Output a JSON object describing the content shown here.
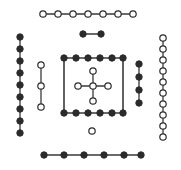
{
  "figure": {
    "title": "",
    "background_color": "#ffffff",
    "edge_color": "#3a3a3a",
    "node_stroke_color": "#2b2b2b",
    "filled_node_color": "#2b2b2b",
    "open_node_color": "#ffffff",
    "width": 181,
    "height": 170
  },
  "chart_data": {
    "type": "scatter",
    "title": "",
    "subtitle": "",
    "xlabel": "",
    "ylabel": "",
    "xlim": [
      0,
      181
    ],
    "ylim": [
      0,
      170
    ],
    "grid": false,
    "legend": null,
    "node_styles": {
      "filled": {
        "fill": "#2b2b2b",
        "stroke": "#2b2b2b",
        "radius": 3.2
      },
      "open": {
        "fill": "#ffffff",
        "stroke": "#2b2b2b",
        "radius": 3.2
      }
    },
    "components": [
      {
        "id": "top-path",
        "name": "top-open-path",
        "shape": "path",
        "node_style": "open",
        "node_count": 7,
        "nodes": [
          {
            "id": "t1",
            "x": 43,
            "y": 14
          },
          {
            "id": "t2",
            "x": 58,
            "y": 14
          },
          {
            "id": "t3",
            "x": 73,
            "y": 14
          },
          {
            "id": "t4",
            "x": 88,
            "y": 14
          },
          {
            "id": "t5",
            "x": 103,
            "y": 14
          },
          {
            "id": "t6",
            "x": 118,
            "y": 14
          },
          {
            "id": "t7",
            "x": 133,
            "y": 14
          }
        ],
        "edges": [
          [
            "t1",
            "t2"
          ],
          [
            "t2",
            "t3"
          ],
          [
            "t3",
            "t4"
          ],
          [
            "t4",
            "t5"
          ],
          [
            "t5",
            "t6"
          ],
          [
            "t6",
            "t7"
          ]
        ]
      },
      {
        "id": "dumbbell",
        "name": "filled-dumbbell",
        "shape": "path",
        "node_style": "filled",
        "node_count": 2,
        "nodes": [
          {
            "id": "d1",
            "x": 83,
            "y": 34
          },
          {
            "id": "d2",
            "x": 101,
            "y": 34
          }
        ],
        "edges": [
          [
            "d1",
            "d2"
          ]
        ]
      },
      {
        "id": "left-column",
        "name": "left-filled-path",
        "shape": "path",
        "node_style": "filled",
        "node_count": 9,
        "nodes": [
          {
            "id": "l1",
            "x": 20,
            "y": 37
          },
          {
            "id": "l2",
            "x": 20,
            "y": 49
          },
          {
            "id": "l3",
            "x": 20,
            "y": 61
          },
          {
            "id": "l4",
            "x": 20,
            "y": 73
          },
          {
            "id": "l5",
            "x": 20,
            "y": 85
          },
          {
            "id": "l6",
            "x": 20,
            "y": 97
          },
          {
            "id": "l7",
            "x": 20,
            "y": 109
          },
          {
            "id": "l8",
            "x": 20,
            "y": 121
          },
          {
            "id": "l9",
            "x": 20,
            "y": 133
          }
        ],
        "edges": [
          [
            "l1",
            "l2"
          ],
          [
            "l2",
            "l3"
          ],
          [
            "l3",
            "l4"
          ],
          [
            "l4",
            "l5"
          ],
          [
            "l5",
            "l6"
          ],
          [
            "l6",
            "l7"
          ],
          [
            "l7",
            "l8"
          ],
          [
            "l8",
            "l9"
          ]
        ]
      },
      {
        "id": "left-inner-column",
        "name": "left-inner-open-path",
        "shape": "path",
        "node_style": "open",
        "node_count": 3,
        "nodes": [
          {
            "id": "li1",
            "x": 41,
            "y": 65
          },
          {
            "id": "li2",
            "x": 41,
            "y": 86
          },
          {
            "id": "li3",
            "x": 41,
            "y": 107
          }
        ],
        "edges": [
          [
            "li1",
            "li2"
          ],
          [
            "li2",
            "li3"
          ]
        ]
      },
      {
        "id": "square-ring",
        "name": "square-ring",
        "shape": "ring",
        "node_style": "filled",
        "node_count": 10,
        "box": {
          "x": 64,
          "y": 58,
          "width": 59,
          "height": 55
        },
        "nodes": [
          {
            "id": "s1",
            "x": 64,
            "y": 58
          },
          {
            "id": "s2",
            "x": 76,
            "y": 58
          },
          {
            "id": "s3",
            "x": 88,
            "y": 58
          },
          {
            "id": "s4",
            "x": 100,
            "y": 58
          },
          {
            "id": "s5",
            "x": 112,
            "y": 58
          },
          {
            "id": "s6",
            "x": 123,
            "y": 58
          },
          {
            "id": "s7",
            "x": 123,
            "y": 113
          },
          {
            "id": "s8",
            "x": 112,
            "y": 113
          },
          {
            "id": "s9",
            "x": 100,
            "y": 113
          },
          {
            "id": "s10",
            "x": 88,
            "y": 113
          },
          {
            "id": "s11",
            "x": 76,
            "y": 113
          },
          {
            "id": "s12",
            "x": 64,
            "y": 113
          }
        ],
        "edges": [
          [
            "s1",
            "s2"
          ],
          [
            "s2",
            "s3"
          ],
          [
            "s3",
            "s4"
          ],
          [
            "s4",
            "s5"
          ],
          [
            "s5",
            "s6"
          ],
          [
            "s6",
            "s7"
          ],
          [
            "s7",
            "s8"
          ],
          [
            "s8",
            "s9"
          ],
          [
            "s9",
            "s10"
          ],
          [
            "s10",
            "s11"
          ],
          [
            "s11",
            "s12"
          ],
          [
            "s12",
            "s1"
          ]
        ]
      },
      {
        "id": "center-star",
        "name": "center-open-star",
        "shape": "star",
        "node_style": "open",
        "node_count": 5,
        "nodes": [
          {
            "id": "c0",
            "x": 93,
            "y": 86
          },
          {
            "id": "cN",
            "x": 93,
            "y": 71
          },
          {
            "id": "cS",
            "x": 93,
            "y": 101
          },
          {
            "id": "cW",
            "x": 78,
            "y": 86
          },
          {
            "id": "cE",
            "x": 108,
            "y": 86
          }
        ],
        "edges": [
          [
            "c0",
            "cN"
          ],
          [
            "c0",
            "cS"
          ],
          [
            "c0",
            "cW"
          ],
          [
            "c0",
            "cE"
          ]
        ]
      },
      {
        "id": "right-inner-column",
        "name": "right-inner-filled-path",
        "shape": "path",
        "node_style": "filled",
        "node_count": 4,
        "nodes": [
          {
            "id": "ri1",
            "x": 139,
            "y": 64
          },
          {
            "id": "ri2",
            "x": 139,
            "y": 77
          },
          {
            "id": "ri3",
            "x": 139,
            "y": 90
          },
          {
            "id": "ri4",
            "x": 139,
            "y": 103
          }
        ],
        "edges": [
          [
            "ri1",
            "ri2"
          ],
          [
            "ri2",
            "ri3"
          ],
          [
            "ri3",
            "ri4"
          ]
        ]
      },
      {
        "id": "right-column",
        "name": "right-open-path",
        "shape": "path",
        "node_style": "open",
        "node_count": 10,
        "nodes": [
          {
            "id": "r1",
            "x": 163,
            "y": 38
          },
          {
            "id": "r2",
            "x": 163,
            "y": 49
          },
          {
            "id": "r3",
            "x": 163,
            "y": 60
          },
          {
            "id": "r4",
            "x": 163,
            "y": 71
          },
          {
            "id": "r5",
            "x": 163,
            "y": 82
          },
          {
            "id": "r6",
            "x": 163,
            "y": 93
          },
          {
            "id": "r7",
            "x": 163,
            "y": 104
          },
          {
            "id": "r8",
            "x": 163,
            "y": 115
          },
          {
            "id": "r9",
            "x": 163,
            "y": 126
          },
          {
            "id": "r10",
            "x": 163,
            "y": 137
          }
        ],
        "edges": [
          [
            "r1",
            "r2"
          ],
          [
            "r2",
            "r3"
          ],
          [
            "r3",
            "r4"
          ],
          [
            "r4",
            "r5"
          ],
          [
            "r5",
            "r6"
          ],
          [
            "r6",
            "r7"
          ],
          [
            "r7",
            "r8"
          ],
          [
            "r8",
            "r9"
          ],
          [
            "r9",
            "r10"
          ]
        ]
      },
      {
        "id": "isolated-node",
        "name": "isolated-open-node",
        "shape": "single",
        "node_style": "open",
        "node_count": 1,
        "nodes": [
          {
            "id": "iso1",
            "x": 92,
            "y": 131
          }
        ],
        "edges": []
      },
      {
        "id": "bottom-path",
        "name": "bottom-filled-path",
        "shape": "path",
        "node_style": "filled",
        "node_count": 6,
        "nodes": [
          {
            "id": "b1",
            "x": 44,
            "y": 155
          },
          {
            "id": "b2",
            "x": 64,
            "y": 155
          },
          {
            "id": "b3",
            "x": 84,
            "y": 155
          },
          {
            "id": "b4",
            "x": 104,
            "y": 155
          },
          {
            "id": "b5",
            "x": 124,
            "y": 155
          },
          {
            "id": "b6",
            "x": 141,
            "y": 155
          }
        ],
        "edges": [
          [
            "b1",
            "b2"
          ],
          [
            "b2",
            "b3"
          ],
          [
            "b3",
            "b4"
          ],
          [
            "b4",
            "b5"
          ],
          [
            "b5",
            "b6"
          ]
        ]
      }
    ]
  }
}
